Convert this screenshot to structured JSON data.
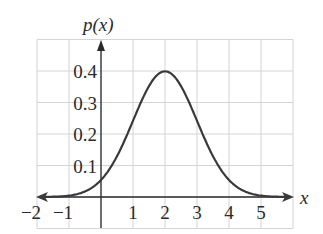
{
  "chart_data": {
    "type": "line",
    "title": "",
    "xlabel": "x",
    "ylabel": "p(x)",
    "xlim": [
      -2,
      6
    ],
    "ylim": [
      -0.1,
      0.5
    ],
    "grid": true,
    "x_ticks": [
      "−2",
      "−1",
      "1",
      "2",
      "3",
      "4",
      "5"
    ],
    "x_tick_values": [
      -2,
      -1,
      1,
      2,
      3,
      4,
      5
    ],
    "y_ticks": [
      "0.1",
      "0.2",
      "0.3",
      "0.4"
    ],
    "y_tick_values": [
      0.1,
      0.2,
      0.3,
      0.4
    ],
    "series": [
      {
        "name": "p(x) normal density, mean 2, sd 1",
        "x": [
          -2,
          -1,
          0,
          0.5,
          1,
          1.5,
          2,
          2.5,
          3,
          3.5,
          4,
          5,
          6
        ],
        "values": [
          0.0001,
          0.004,
          0.054,
          0.13,
          0.242,
          0.352,
          0.399,
          0.352,
          0.242,
          0.13,
          0.054,
          0.004,
          0.0001
        ]
      }
    ],
    "annotations": "Curve has arrowheads at both ends along the x-axis"
  },
  "labels": {
    "y_axis": "p(x)",
    "x_axis": "x"
  }
}
